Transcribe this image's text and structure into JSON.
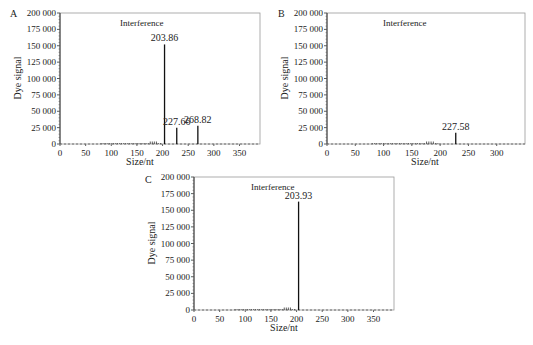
{
  "chart_data": [
    {
      "panel": "A",
      "type": "line",
      "title": "Interference",
      "xlabel": "Size/nt",
      "ylabel": "Dye signal",
      "xlim": [
        0,
        390
      ],
      "ylim": [
        0,
        200000
      ],
      "xticks": [
        "0",
        "50",
        "100",
        "150",
        "200",
        "250",
        "300",
        "350"
      ],
      "yticks": [
        "0",
        "25 000",
        "50 000",
        "75 000",
        "100 000",
        "125 000",
        "150 000",
        "175 000",
        "200 000"
      ],
      "peaks": [
        {
          "x": 203.86,
          "y": 152000,
          "label": "203.86"
        },
        {
          "x": 227.66,
          "y": 25000,
          "label": "227.66"
        },
        {
          "x": 268.82,
          "y": 28000,
          "label": "268.82"
        }
      ],
      "grid": false
    },
    {
      "panel": "B",
      "type": "line",
      "title": "Interference",
      "xlabel": "Size/nt",
      "ylabel": "Dye signal",
      "xlim": [
        0,
        350
      ],
      "ylim": [
        0,
        200000
      ],
      "xticks": [
        "0",
        "50",
        "100",
        "150",
        "200",
        "250",
        "300"
      ],
      "yticks": [
        "0",
        "25 000",
        "50 000",
        "75 000",
        "100 000",
        "125 000",
        "150 000",
        "175 000",
        "200 000"
      ],
      "peaks": [
        {
          "x": 227.58,
          "y": 17000,
          "label": "227.58"
        }
      ],
      "grid": false
    },
    {
      "panel": "C",
      "type": "line",
      "title": "Interference",
      "xlabel": "Size/nt",
      "ylabel": "Dye signal",
      "xlim": [
        0,
        390
      ],
      "ylim": [
        0,
        200000
      ],
      "xticks": [
        "0",
        "50",
        "100",
        "150",
        "200",
        "250",
        "300",
        "350"
      ],
      "yticks": [
        "0",
        "25 000",
        "50 000",
        "75 000",
        "100 000",
        "125 000",
        "150 000",
        "175 000",
        "200 000"
      ],
      "peaks": [
        {
          "x": 203.93,
          "y": 163000,
          "label": "203.93"
        }
      ],
      "grid": false
    }
  ],
  "panels": {
    "A": {
      "letter": "A",
      "title": "Interference",
      "xlabel": "Size/nt",
      "ylabel": "Dye signal"
    },
    "B": {
      "letter": "B",
      "title": "Interference",
      "xlabel": "Size/nt",
      "ylabel": "Dye signal"
    },
    "C": {
      "letter": "C",
      "title": "Interference",
      "xlabel": "Size/nt",
      "ylabel": "Dye signal"
    }
  }
}
